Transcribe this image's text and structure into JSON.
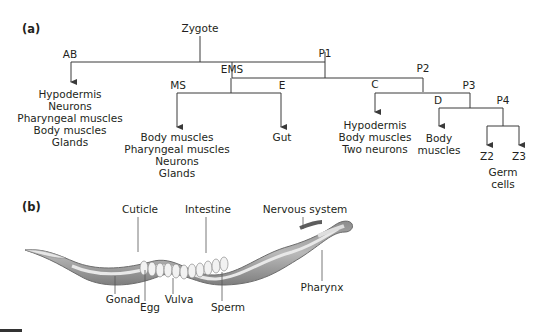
{
  "panel_a": {
    "label": "(a)",
    "root": "Zygote",
    "nodes": {
      "ab": "AB",
      "p1": "P1",
      "ems": "EMS",
      "ms": "MS",
      "e": "E",
      "p2": "P2",
      "c": "C",
      "p3": "P3",
      "d": "D",
      "p4": "P4",
      "z2": "Z2",
      "z3": "Z3"
    },
    "fates": {
      "ab": [
        "Hypodermis",
        "Neurons",
        "Pharyngeal muscles",
        "Body muscles",
        "Glands"
      ],
      "ms": [
        "Body muscles",
        "Pharyngeal muscles",
        "Neurons",
        "Glands"
      ],
      "e": [
        "Gut"
      ],
      "c": [
        "Hypodermis",
        "Body muscles",
        "Two neurons"
      ],
      "d": [
        "Body",
        "muscles"
      ],
      "germ": [
        "Germ",
        "cells"
      ]
    }
  },
  "panel_b": {
    "label": "(b)",
    "structures": {
      "cuticle": "Cuticle",
      "intestine": "Intestine",
      "nervous_system": "Nervous system",
      "gonad": "Gonad",
      "egg": "Egg",
      "vulva": "Vulva",
      "sperm": "Sperm",
      "pharynx": "Pharynx"
    }
  }
}
